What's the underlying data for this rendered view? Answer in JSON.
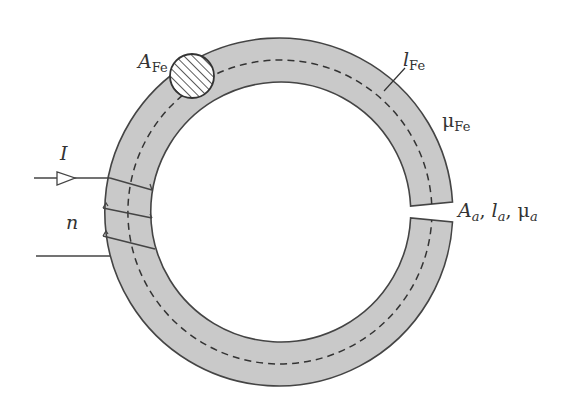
{
  "diagram": {
    "type": "magnetic circuit (toroidal iron core with air gap and coil)",
    "colors": {
      "core_fill": "#c9c9c9",
      "outline": "#444444",
      "dashed_path": "#333333",
      "background": "#ffffff"
    },
    "labels": {
      "core_area": {
        "main": "A",
        "sub": "Fe"
      },
      "core_length": {
        "main": "l",
        "sub": "Fe"
      },
      "core_permeability": {
        "main": "μ",
        "sub": "Fe"
      },
      "gap_area": {
        "main": "A",
        "sub": "a"
      },
      "gap_length": {
        "main": "l",
        "sub": "a"
      },
      "gap_permeability": {
        "main": "μ",
        "sub": "a"
      },
      "current": "I",
      "turns": "n",
      "separator": ","
    }
  }
}
